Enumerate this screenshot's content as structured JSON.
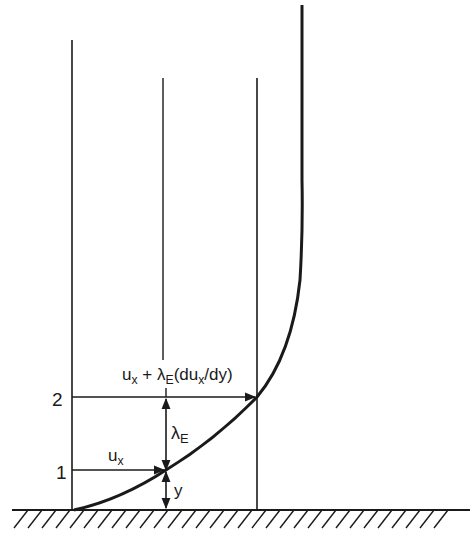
{
  "diagram": {
    "type": "velocity-profile-mixing-length",
    "level_labels": {
      "level2": "2",
      "level1": "1"
    },
    "formula": {
      "u": "u",
      "u_sub": "x",
      "plus": " + ",
      "lambda": "λ",
      "lambda_sub": "E",
      "paren_open": "(du",
      "du_sub": "x",
      "paren_close": "/dy)"
    },
    "ux_label": {
      "u": "u",
      "sub": "x"
    },
    "lambda_label": {
      "lambda": "λ",
      "sub": "E"
    },
    "y_label": "y",
    "colors": {
      "ink": "#1a1a1a",
      "background": "#ffffff"
    }
  }
}
